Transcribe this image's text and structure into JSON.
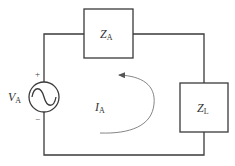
{
  "diagram": {
    "type": "ac-circuit",
    "source": {
      "symbol": "V",
      "subscript": "A",
      "plus": "+",
      "minus": "−"
    },
    "impedance_source": {
      "symbol": "Z",
      "subscript": "A"
    },
    "impedance_load": {
      "symbol": "Z",
      "subscript": "L"
    },
    "current": {
      "symbol": "I",
      "subscript": "A"
    },
    "colors": {
      "wire": "#3a3a3a",
      "loop_arrow": "#777777",
      "background": "#ffffff"
    }
  }
}
